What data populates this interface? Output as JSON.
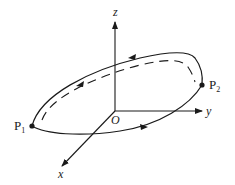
{
  "diagram": {
    "axes": {
      "z_label": "z",
      "y_label": "y",
      "x_label": "x",
      "origin_label": "O"
    },
    "points": [
      {
        "name": "P",
        "subscript": "1"
      },
      {
        "name": "P",
        "subscript": "2"
      }
    ],
    "colors": {
      "stroke": "#1a1a1a",
      "background": "#ffffff"
    }
  }
}
